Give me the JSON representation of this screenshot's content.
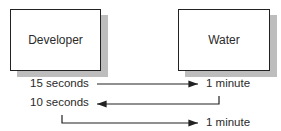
{
  "diagram": {
    "nodes": [
      {
        "id": "developer",
        "label": "Developer"
      },
      {
        "id": "water",
        "label": "Water"
      }
    ],
    "steps": [
      {
        "left": "15 seconds",
        "right": "1 minute",
        "direction": "left-to-right"
      },
      {
        "left": "10 seconds",
        "direction": "right-to-left"
      },
      {
        "right": "1 minute",
        "direction": "left-to-right"
      }
    ]
  }
}
